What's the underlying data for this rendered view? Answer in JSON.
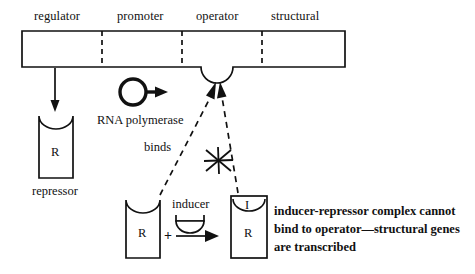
{
  "figure": {
    "background_color": "#ffffff",
    "ink_color": "#111111"
  },
  "gene_bar": {
    "segments": [
      {
        "label": "regulator"
      },
      {
        "label": "promoter"
      },
      {
        "label": "operator"
      },
      {
        "label": "structural"
      }
    ]
  },
  "labels": {
    "rna_polymerase": "RNA polymerase",
    "binds": "binds",
    "repressor": "repressor",
    "inducer": "inducer",
    "plus": "+"
  },
  "glyphs": {
    "repressor_letter": "R",
    "complex_repressor_letter": "R",
    "complex_inducer_letter": "I"
  },
  "annotation": {
    "lines": [
      "inducer-repressor complex cannot",
      "bind to operator—structural genes",
      "are transcribed"
    ]
  }
}
